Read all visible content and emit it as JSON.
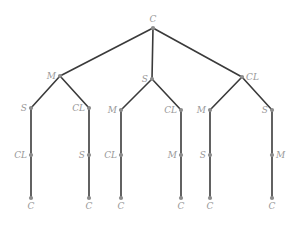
{
  "figure": {
    "type": "tree-diagram",
    "title": "",
    "width": 296,
    "height": 226,
    "background_color": "#ffffff",
    "edge_color": "#3a3a3a",
    "node_color": "#8c8c8c",
    "label_color": "#999999",
    "node_radius": 2.1,
    "edge_width": 1.6
  },
  "nodes": [
    {
      "id": "n0",
      "label": "C",
      "x": 153,
      "y": 28,
      "level": 0,
      "label_pos": "above"
    },
    {
      "id": "n1",
      "label": "M",
      "x": 60,
      "y": 76,
      "level": 1,
      "label_pos": "left"
    },
    {
      "id": "n2",
      "label": "S",
      "x": 152,
      "y": 79,
      "level": 1,
      "label_pos": "left"
    },
    {
      "id": "n3",
      "label": "CL",
      "x": 242,
      "y": 77,
      "level": 1,
      "label_pos": "right"
    },
    {
      "id": "n4",
      "label": "S",
      "x": 31,
      "y": 108,
      "level": 2,
      "label_pos": "left"
    },
    {
      "id": "n5",
      "label": "CL",
      "x": 89,
      "y": 108,
      "level": 2,
      "label_pos": "left"
    },
    {
      "id": "n6",
      "label": "M",
      "x": 121,
      "y": 110,
      "level": 2,
      "label_pos": "left"
    },
    {
      "id": "n7",
      "label": "CL",
      "x": 181,
      "y": 110,
      "level": 2,
      "label_pos": "left"
    },
    {
      "id": "n8",
      "label": "M",
      "x": 210,
      "y": 110,
      "level": 2,
      "label_pos": "left"
    },
    {
      "id": "n9",
      "label": "S",
      "x": 272,
      "y": 110,
      "level": 2,
      "label_pos": "left"
    },
    {
      "id": "n10",
      "label": "CL",
      "x": 31,
      "y": 155,
      "level": 3,
      "label_pos": "left"
    },
    {
      "id": "n11",
      "label": "S",
      "x": 89,
      "y": 155,
      "level": 3,
      "label_pos": "left"
    },
    {
      "id": "n12",
      "label": "CL",
      "x": 121,
      "y": 155,
      "level": 3,
      "label_pos": "left"
    },
    {
      "id": "n13",
      "label": "M",
      "x": 181,
      "y": 155,
      "level": 3,
      "label_pos": "left"
    },
    {
      "id": "n14",
      "label": "S",
      "x": 210,
      "y": 155,
      "level": 3,
      "label_pos": "left"
    },
    {
      "id": "n15",
      "label": "M",
      "x": 272,
      "y": 155,
      "level": 3,
      "label_pos": "right"
    },
    {
      "id": "n16",
      "label": "C",
      "x": 31,
      "y": 198,
      "level": 4,
      "label_pos": "below"
    },
    {
      "id": "n17",
      "label": "C",
      "x": 89,
      "y": 198,
      "level": 4,
      "label_pos": "below"
    },
    {
      "id": "n18",
      "label": "C",
      "x": 121,
      "y": 198,
      "level": 4,
      "label_pos": "below"
    },
    {
      "id": "n19",
      "label": "C",
      "x": 181,
      "y": 198,
      "level": 4,
      "label_pos": "below"
    },
    {
      "id": "n20",
      "label": "C",
      "x": 210,
      "y": 198,
      "level": 4,
      "label_pos": "below"
    },
    {
      "id": "n21",
      "label": "C",
      "x": 272,
      "y": 198,
      "level": 4,
      "label_pos": "below"
    }
  ],
  "edges": [
    {
      "from": "n0",
      "to": "n1"
    },
    {
      "from": "n0",
      "to": "n2"
    },
    {
      "from": "n0",
      "to": "n3"
    },
    {
      "from": "n1",
      "to": "n4"
    },
    {
      "from": "n1",
      "to": "n5"
    },
    {
      "from": "n2",
      "to": "n6"
    },
    {
      "from": "n2",
      "to": "n7"
    },
    {
      "from": "n3",
      "to": "n8"
    },
    {
      "from": "n3",
      "to": "n9"
    },
    {
      "from": "n4",
      "to": "n10"
    },
    {
      "from": "n5",
      "to": "n11"
    },
    {
      "from": "n6",
      "to": "n12"
    },
    {
      "from": "n7",
      "to": "n13"
    },
    {
      "from": "n8",
      "to": "n14"
    },
    {
      "from": "n9",
      "to": "n15"
    },
    {
      "from": "n10",
      "to": "n16"
    },
    {
      "from": "n11",
      "to": "n17"
    },
    {
      "from": "n12",
      "to": "n18"
    },
    {
      "from": "n13",
      "to": "n19"
    },
    {
      "from": "n14",
      "to": "n20"
    },
    {
      "from": "n15",
      "to": "n21"
    }
  ]
}
